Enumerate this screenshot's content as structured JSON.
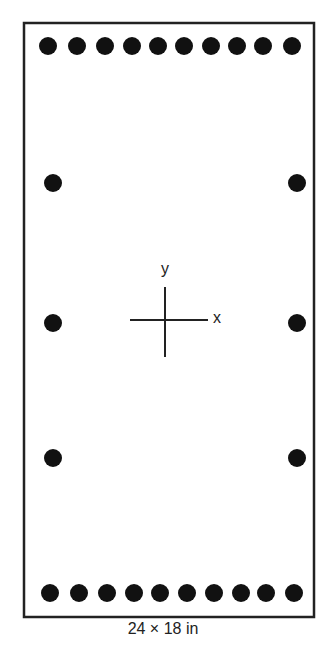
{
  "figure": {
    "caption": "24 × 18 in",
    "section": {
      "left": 24,
      "top": 23,
      "right": 314,
      "bottom": 617,
      "stroke": "#222222"
    },
    "bar_color": "#111111",
    "bar_radius": 9,
    "top_row": {
      "y": 46,
      "x": [
        48,
        77,
        105,
        132,
        158,
        184,
        211,
        237,
        263,
        292
      ]
    },
    "bottom_row": {
      "y": 593,
      "x": [
        50,
        79,
        107,
        134,
        160,
        187,
        214,
        241,
        266,
        294
      ]
    },
    "left_column": {
      "x": 53,
      "y": [
        183,
        323,
        458
      ]
    },
    "right_column": {
      "x": 297,
      "y": [
        183,
        323,
        458
      ]
    },
    "axes": {
      "center_x": 165,
      "center_y": 320,
      "h_half_len": 35,
      "v_half_len": 35,
      "x_label": "x",
      "y_label": "y"
    }
  }
}
